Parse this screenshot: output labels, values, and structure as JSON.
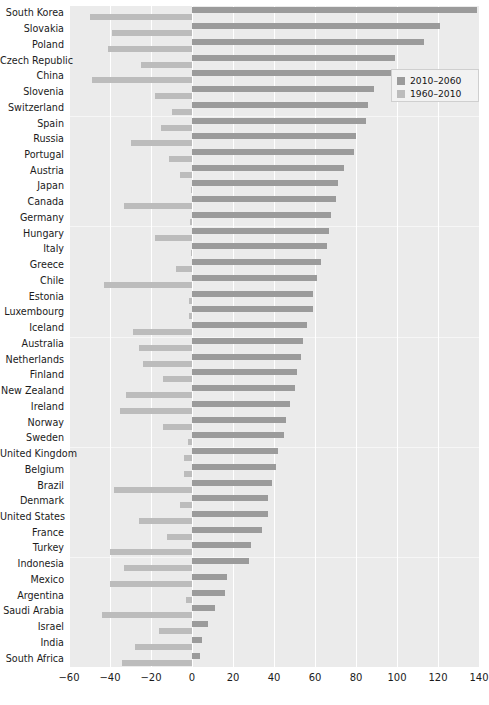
{
  "chart_data": {
    "type": "bar",
    "orientation": "horizontal",
    "title": "",
    "xlabel": "",
    "ylabel": "",
    "xlim": [
      -60,
      140
    ],
    "xticks": [
      -60,
      -40,
      -20,
      0,
      20,
      40,
      60,
      80,
      100,
      120,
      140
    ],
    "xticklabels": [
      "−60",
      "−40",
      "−20",
      "0",
      "20",
      "40",
      "60",
      "80",
      "100",
      "120",
      "140"
    ],
    "grid": true,
    "grid_axis": "x",
    "legend": {
      "position": "top-right",
      "entries": [
        {
          "label": "2010–2060",
          "color": "#9b9b9b"
        },
        {
          "label": "1960–2010",
          "color": "#bcbcbc"
        }
      ]
    },
    "categories": [
      "South Korea",
      "Slovakia",
      "Poland",
      "Czech Republic",
      "China",
      "Slovenia",
      "Switzerland",
      "Spain",
      "Russia",
      "Portugal",
      "Austria",
      "Japan",
      "Canada",
      "Germany",
      "Hungary",
      "Italy",
      "Greece",
      "Chile",
      "Estonia",
      "Luxembourg",
      "Iceland",
      "Australia",
      "Netherlands",
      "Finland",
      "New Zealand",
      "Ireland",
      "Norway",
      "Sweden",
      "United Kingdom",
      "Belgium",
      "Brazil",
      "Denmark",
      "United States",
      "France",
      "Turkey",
      "Indonesia",
      "Mexico",
      "Argentina",
      "Saudi Arabia",
      "Israel",
      "India",
      "South Africa"
    ],
    "series": [
      {
        "name": "2010–2060",
        "color": "#9b9b9b",
        "values": [
          139,
          121,
          113,
          99,
          98,
          89,
          86,
          85,
          80,
          79,
          74,
          71,
          70,
          68,
          67,
          66,
          63,
          61,
          59,
          59,
          56,
          54,
          53,
          51,
          50,
          48,
          46,
          45,
          42,
          41,
          39,
          37,
          37,
          34,
          29,
          28,
          17,
          16,
          11,
          8,
          5,
          4
        ]
      },
      {
        "name": "1960–2010",
        "color": "#bcbcbc",
        "values": [
          -50,
          -39,
          -41,
          -25,
          -49,
          -18,
          -10,
          -15,
          -30,
          -11,
          -6,
          -0.5,
          -33,
          -1,
          -18,
          -0.5,
          -8,
          -43,
          -1.5,
          -1.5,
          -29,
          -26,
          -24,
          -14,
          -32,
          -35,
          -14,
          -2,
          -4,
          -4,
          -38,
          -6,
          -26,
          -12,
          -40,
          -33,
          -40,
          -3,
          -44,
          -16,
          -28,
          -34
        ]
      }
    ]
  }
}
